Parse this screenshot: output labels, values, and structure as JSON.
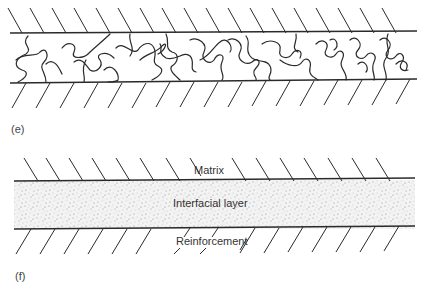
{
  "figure": {
    "panels": [
      {
        "id": "e",
        "label": "(e)",
        "description": "Interface region between two hatched surfaces filled with entangled polymer chains"
      },
      {
        "id": "f",
        "label": "(f)",
        "description": "Stippled interfacial layer between matrix and reinforcement",
        "labels": {
          "matrix": "Matrix",
          "interfacial_layer": "Interfacial layer",
          "reinforcement": "Reinforcement"
        }
      }
    ]
  },
  "colors": {
    "line": "#2a2a2a",
    "stipple": "#8a8a8a",
    "background": "#ffffff"
  }
}
